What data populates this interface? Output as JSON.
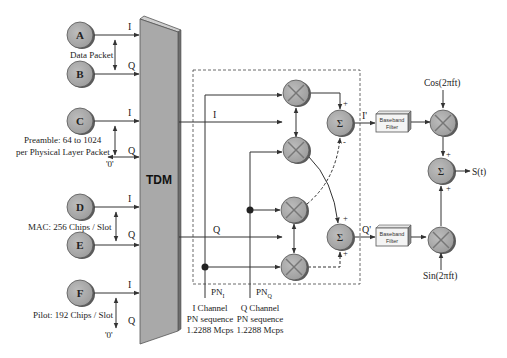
{
  "colors": {
    "node_fill": "#a8a8a8",
    "node_shadow": "#5a5a5a",
    "tdm_fill": "#a9a9a9",
    "line": "#333333",
    "text": "#222222"
  },
  "sources": [
    {
      "id": "A",
      "label": "A",
      "cx": 80,
      "cy": 35,
      "output": "I"
    },
    {
      "id": "B",
      "label": "B",
      "cx": 80,
      "cy": 74,
      "output": "Q"
    },
    {
      "id": "C",
      "label": "C",
      "cx": 80,
      "cy": 121,
      "output": "I"
    },
    {
      "id": "D",
      "label": "D",
      "cx": 80,
      "cy": 207,
      "output": "I"
    },
    {
      "id": "E",
      "label": "E",
      "cx": 80,
      "cy": 245,
      "output": "Q"
    },
    {
      "id": "F",
      "label": "F",
      "cx": 80,
      "cy": 293,
      "output": "I"
    }
  ],
  "annotations": {
    "data_packet": "Data Packet",
    "preamble_line1": "Preamble: 64 to 1024",
    "preamble_line2": "per Physical Layer Packet",
    "mac": "MAC: 256 Chips / Slot",
    "pilot": "Pilot: 192 Chips / Slot",
    "zero_c": "'0'",
    "zero_f": "'0'"
  },
  "tdm": {
    "label": "TDM"
  },
  "channels": {
    "i_in": "I",
    "q_in": "Q",
    "i_prime": "I'",
    "q_prime": "Q'",
    "pn_i": "PN",
    "pn_i_sub": "I",
    "pn_q": "PN",
    "pn_q_sub": "Q"
  },
  "pn_sequences": {
    "i": {
      "line1": "I  Channel",
      "line2": "PN sequence",
      "line3": "1.2288 Mcps"
    },
    "q": {
      "line1": "Q  Channel",
      "line2": "PN sequence",
      "line3": "1.2288 Mcps"
    }
  },
  "filters": {
    "i": {
      "line1": "Baseband",
      "line2": "Filter"
    },
    "q": {
      "line1": "Baseband",
      "line2": "Filter"
    }
  },
  "summers": {
    "symbol": "Σ"
  },
  "carriers": {
    "cos": "Cos(2πft)",
    "sin": "Sin(2πft)"
  },
  "output": {
    "label": "S(t)"
  },
  "signs": {
    "plus": "+",
    "minus": "-"
  }
}
